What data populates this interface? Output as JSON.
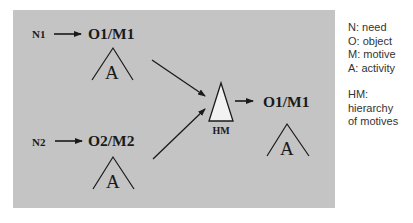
{
  "diagram": {
    "top_branch": {
      "need": "N1",
      "object_motive": "O1/M1",
      "activity": "A"
    },
    "bottom_branch": {
      "need": "N2",
      "object_motive": "O2/M2",
      "activity": "A"
    },
    "hierarchy": {
      "label": "HM"
    },
    "result": {
      "object_motive": "O1/M1",
      "activity": "A"
    }
  },
  "legend": {
    "definitions": [
      "N: need",
      "O: object",
      "M: motive",
      "A: activity"
    ],
    "hm_definition": [
      "HM:",
      "hierarchy",
      "of motives"
    ]
  },
  "colors": {
    "panel": "#c4c4c4",
    "ink": "#1a1a1a",
    "hm_fill": "#f2f2f2",
    "legend_text": "#333333"
  }
}
